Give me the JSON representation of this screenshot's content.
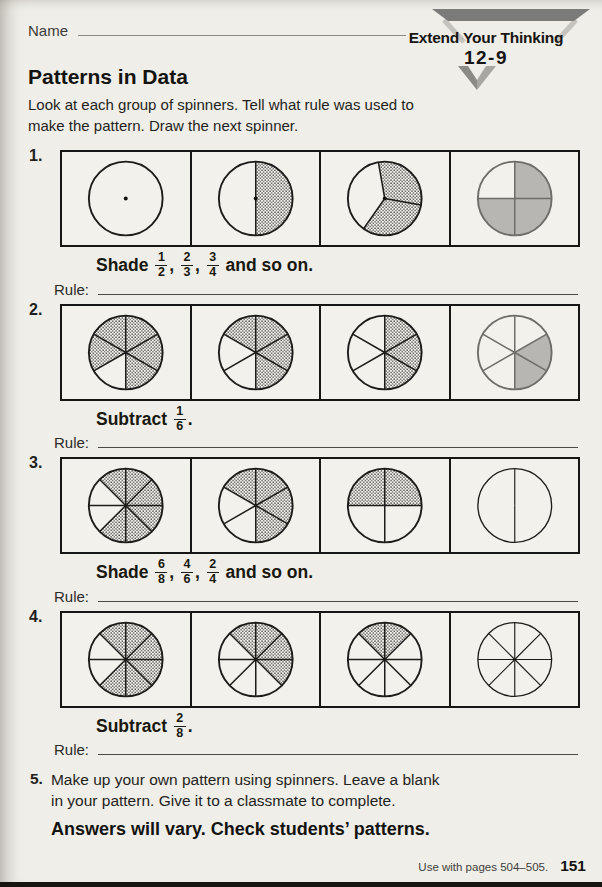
{
  "page": {
    "name_label": "Name",
    "logo": {
      "banner": "Extend Your Thinking",
      "lesson": "12-9"
    },
    "title": "Patterns in Data",
    "instructions": "Look at each group of spinners. Tell what rule was used to\nmake the pattern. Draw the next spinner.",
    "rule_label": "Rule:",
    "footer": {
      "use_with": "Use with pages 504–505.",
      "page_number": "151"
    },
    "colors": {
      "ink": "#1c1c1a",
      "answer_fill": "#b7b6b2",
      "hatch_dot": "#2e2e2c",
      "logo_gray": "#7b7b79"
    }
  },
  "problems": [
    {
      "number": "1.",
      "caption": [
        {
          "text": "Shade "
        },
        {
          "frac": [
            "1",
            "2"
          ]
        },
        {
          "text": ", "
        },
        {
          "frac": [
            "2",
            "3"
          ]
        },
        {
          "text": ", "
        },
        {
          "frac": [
            "3",
            "4"
          ]
        },
        {
          "text": " and so on."
        }
      ],
      "spinners": [
        {
          "boundaries": [],
          "shaded": [],
          "fill": "none",
          "dot": true,
          "ink": "normal"
        },
        {
          "boundaries": [
            0,
            180
          ],
          "shaded": [
            0
          ],
          "fill": "hatch",
          "dot": true,
          "ink": "normal"
        },
        {
          "boundaries": [
            350,
            100,
            215
          ],
          "shaded": [
            0,
            1
          ],
          "fill": "hatch",
          "dot": true,
          "ink": "normal"
        },
        {
          "boundaries": [
            0,
            90,
            180,
            270
          ],
          "shaded": [
            0,
            1,
            2
          ],
          "fill": "gray",
          "dot": false,
          "ink": "answer"
        }
      ]
    },
    {
      "number": "2.",
      "caption": [
        {
          "text": "Subtract "
        },
        {
          "frac": [
            "1",
            "6"
          ]
        },
        {
          "text": "."
        }
      ],
      "spinners": [
        {
          "boundaries": [
            0,
            60,
            120,
            180,
            240,
            300
          ],
          "shaded": [
            0,
            1,
            2,
            4,
            5
          ],
          "fill": "hatch",
          "dot": false,
          "ink": "normal"
        },
        {
          "boundaries": [
            0,
            60,
            120,
            180,
            240,
            300
          ],
          "shaded": [
            0,
            1,
            2,
            5
          ],
          "fill": "hatch",
          "dot": false,
          "ink": "normal"
        },
        {
          "boundaries": [
            0,
            60,
            120,
            180,
            240,
            300
          ],
          "shaded": [
            0,
            1,
            2
          ],
          "fill": "hatch",
          "dot": false,
          "ink": "normal"
        },
        {
          "boundaries": [
            0,
            60,
            120,
            180,
            240,
            300
          ],
          "shaded": [
            1,
            2
          ],
          "fill": "gray",
          "dot": false,
          "ink": "answer"
        }
      ]
    },
    {
      "number": "3.",
      "caption": [
        {
          "text": "Shade "
        },
        {
          "frac": [
            "6",
            "8"
          ]
        },
        {
          "text": ", "
        },
        {
          "frac": [
            "4",
            "6"
          ]
        },
        {
          "text": ", "
        },
        {
          "frac": [
            "2",
            "4"
          ]
        },
        {
          "text": " and so on."
        }
      ],
      "spinners": [
        {
          "boundaries": [
            0,
            45,
            90,
            135,
            180,
            225,
            270,
            315
          ],
          "shaded": [
            0,
            1,
            2,
            3,
            4,
            7
          ],
          "fill": "hatch",
          "dot": false,
          "ink": "normal"
        },
        {
          "boundaries": [
            0,
            60,
            120,
            180,
            240,
            300
          ],
          "shaded": [
            0,
            1,
            2,
            5
          ],
          "fill": "hatch",
          "dot": false,
          "ink": "normal"
        },
        {
          "boundaries": [
            0,
            90,
            180,
            270
          ],
          "shaded": [
            0,
            3
          ],
          "fill": "hatch",
          "dot": false,
          "ink": "normal"
        },
        {
          "boundaries": [
            0,
            180
          ],
          "shaded": [],
          "fill": "none",
          "dot": false,
          "ink": "thin"
        }
      ]
    },
    {
      "number": "4.",
      "caption": [
        {
          "text": "Subtract "
        },
        {
          "frac": [
            "2",
            "8"
          ]
        },
        {
          "text": "."
        }
      ],
      "spinners": [
        {
          "boundaries": [
            0,
            45,
            90,
            135,
            180,
            225,
            270,
            315
          ],
          "shaded": [
            0,
            1,
            2,
            3,
            4,
            7
          ],
          "fill": "hatch",
          "dot": false,
          "ink": "normal"
        },
        {
          "boundaries": [
            0,
            45,
            90,
            135,
            180,
            225,
            270,
            315
          ],
          "shaded": [
            0,
            1,
            2,
            7
          ],
          "fill": "hatch",
          "dot": false,
          "ink": "normal"
        },
        {
          "boundaries": [
            0,
            45,
            90,
            135,
            180,
            225,
            270,
            315
          ],
          "shaded": [
            0,
            7
          ],
          "fill": "hatch",
          "dot": false,
          "ink": "normal"
        },
        {
          "boundaries": [
            0,
            45,
            90,
            135,
            180,
            225,
            270,
            315
          ],
          "shaded": [],
          "fill": "none",
          "dot": false,
          "ink": "thin"
        }
      ]
    }
  ],
  "problem5": {
    "number": "5.",
    "text": "Make up your own pattern using spinners. Leave a blank\nin your pattern. Give it to a classmate to complete.",
    "answer": "Answers will vary. Check students’ patterns."
  }
}
